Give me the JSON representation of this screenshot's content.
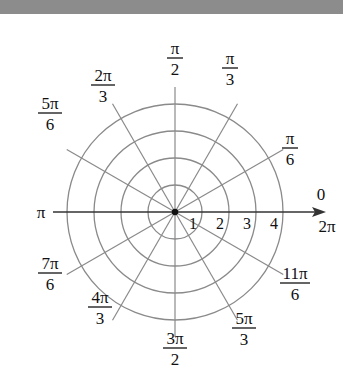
{
  "diagram": {
    "type": "polar-grid",
    "center": [
      175,
      212
    ],
    "ring_radius_px": 27,
    "rings": [
      1,
      2,
      3,
      4
    ],
    "ring_labels": [
      "1",
      "2",
      "3",
      "4"
    ],
    "angle_labels": [
      {
        "num": "π",
        "den": "2",
        "deg": 90
      },
      {
        "num": "π",
        "den": "3",
        "deg": 60
      },
      {
        "num": "2π",
        "den": "3",
        "deg": 120
      },
      {
        "num": "π",
        "den": "6",
        "deg": 30
      },
      {
        "num": "5π",
        "den": "6",
        "deg": 150
      },
      {
        "num": "7π",
        "den": "6",
        "deg": 210
      },
      {
        "num": "4π",
        "den": "3",
        "deg": 240
      },
      {
        "num": "3π",
        "den": "2",
        "deg": 270
      },
      {
        "num": "5π",
        "den": "3",
        "deg": 300
      },
      {
        "num": "11π",
        "den": "6",
        "deg": 330
      }
    ],
    "axis_right_top": "0",
    "axis_right_bottom": "2π",
    "axis_left": "π",
    "colors": {
      "grid": "#8a8a8a",
      "axis": "#333333",
      "bar": "#8c8c8c"
    }
  }
}
